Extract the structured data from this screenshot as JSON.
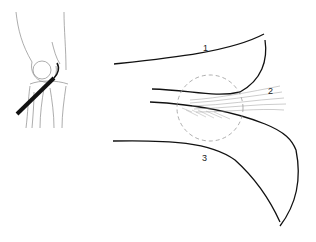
{
  "figure": {
    "inset": {
      "description": "knee-joint-outline-with-arthroscope"
    },
    "labels": [
      {
        "id": "1",
        "text": "1"
      },
      {
        "id": "2",
        "text": "2"
      },
      {
        "id": "3",
        "text": "3"
      }
    ],
    "colors": {
      "line": "#111111",
      "thin": "#888888",
      "dashed": "#999999",
      "instrument": "#111111"
    }
  }
}
